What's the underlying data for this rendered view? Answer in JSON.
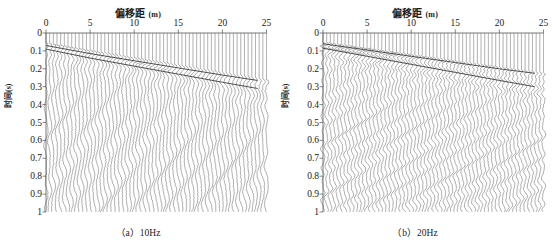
{
  "figure": {
    "width": 553,
    "height": 245,
    "background": "#ffffff",
    "ink_color": "#3a3a3a",
    "text_color": "#1a1a1a"
  },
  "panels": [
    {
      "id": "panel-a",
      "caption": "（a）10Hz",
      "frequency_hz": 10,
      "axis": {
        "xlabel": "偏移距",
        "xunit": "(m)",
        "ylabel": "时间",
        "yunit": "(s)",
        "xticks": [
          0,
          5,
          10,
          15,
          20,
          25
        ],
        "xticklabels": [
          "0",
          "5",
          "10",
          "15",
          "20",
          "25"
        ],
        "yticks": [
          0,
          0.1,
          0.2,
          0.3,
          0.4,
          0.5,
          0.6,
          0.7,
          0.8,
          0.9,
          1
        ],
        "yticklabels": [
          "0",
          "0.1",
          "0.2",
          "0.3",
          "0.4",
          "0.5",
          "0.6",
          "0.7",
          "0.8",
          "0.9",
          "1"
        ],
        "xlim": [
          0,
          25
        ],
        "ylim": [
          0,
          1
        ],
        "y_inverted": true
      }
    },
    {
      "id": "panel-b",
      "caption": "（b）20Hz",
      "frequency_hz": 20,
      "axis": {
        "xlabel": "偏移距",
        "xunit": "(m)",
        "ylabel": "时间",
        "yunit": "(s)",
        "xticks": [
          0,
          5,
          10,
          15,
          20,
          25
        ],
        "xticklabels": [
          "0",
          "5",
          "10",
          "15",
          "20",
          "25"
        ],
        "yticks": [
          0,
          0.1,
          0.2,
          0.3,
          0.4,
          0.5,
          0.6,
          0.7,
          0.8,
          0.9,
          1
        ],
        "yticklabels": [
          "0",
          "0.1",
          "0.2",
          "0.3",
          "0.4",
          "0.5",
          "0.6",
          "0.7",
          "0.8",
          "0.9",
          "1"
        ],
        "xlim": [
          0,
          25
        ],
        "ylim": [
          0,
          1
        ],
        "y_inverted": true
      }
    }
  ],
  "chart_data": [
    {
      "type": "line",
      "title": "（a）10Hz",
      "xlabel": "偏移距 (m)",
      "ylabel": "时间 (s)",
      "xlim": [
        0,
        25
      ],
      "ylim": [
        0,
        1
      ],
      "y_inverted": true,
      "grid": false,
      "legend": "none",
      "plot_kind": "seismic-wiggle-shot-gather",
      "dominant_frequency_hz": 10,
      "n_traces": 61,
      "trace_offsets_m_start": 0,
      "trace_offsets_m_end": 25,
      "trace_offset_step_m": 0.4166,
      "time_samples_s": [
        0,
        1
      ],
      "annotations": [
        {
          "name": "first-arrival-refraction",
          "description": "linear first-arrival event sloping down to the right",
          "points": [
            [
              0,
              0.07
            ],
            [
              5,
              0.115
            ],
            [
              10,
              0.155
            ],
            [
              15,
              0.195
            ],
            [
              20,
              0.235
            ],
            [
              24,
              0.265
            ]
          ]
        },
        {
          "name": "ground-roll-dispersive-train",
          "description": "low-frequency dispersive surface wave train below first arrivals",
          "points": [
            [
              0,
              0.09
            ],
            [
              5,
              0.14
            ],
            [
              10,
              0.185
            ],
            [
              15,
              0.23
            ],
            [
              20,
              0.275
            ],
            [
              24,
              0.31
            ]
          ]
        }
      ]
    },
    {
      "type": "line",
      "title": "（b）20Hz",
      "xlabel": "偏移距 (m)",
      "ylabel": "时间 (s)",
      "xlim": [
        0,
        25
      ],
      "ylim": [
        0,
        1
      ],
      "y_inverted": true,
      "grid": false,
      "legend": "none",
      "plot_kind": "seismic-wiggle-shot-gather",
      "dominant_frequency_hz": 20,
      "n_traces": 61,
      "trace_offsets_m_start": 0,
      "trace_offsets_m_end": 25,
      "trace_offset_step_m": 0.4166,
      "time_samples_s": [
        0,
        1
      ],
      "annotations": [
        {
          "name": "first-arrival-refraction",
          "description": "linear first-arrival event sloping down to the right",
          "points": [
            [
              0,
              0.06
            ],
            [
              5,
              0.095
            ],
            [
              10,
              0.13
            ],
            [
              15,
              0.165
            ],
            [
              20,
              0.2
            ],
            [
              24,
              0.225
            ]
          ]
        },
        {
          "name": "ground-roll-dispersive-train",
          "description": "higher-frequency dispersive surface wave train below first arrivals",
          "points": [
            [
              0,
              0.085
            ],
            [
              5,
              0.13
            ],
            [
              10,
              0.175
            ],
            [
              15,
              0.22
            ],
            [
              20,
              0.265
            ],
            [
              24,
              0.3
            ]
          ]
        }
      ]
    }
  ]
}
